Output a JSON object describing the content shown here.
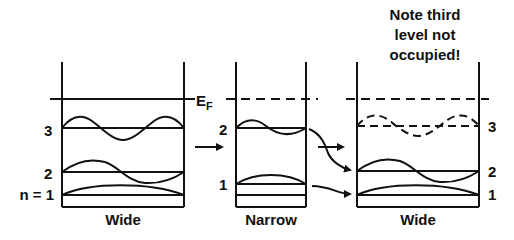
{
  "diagram": {
    "note": [
      "Note third",
      "level not",
      "occupied!"
    ],
    "fermi_label": "E",
    "fermi_sub": "F",
    "wells": [
      {
        "name": "wide-left",
        "label": "Wide",
        "levels": [
          "3",
          "2",
          "n = 1"
        ]
      },
      {
        "name": "narrow",
        "label": "Narrow",
        "levels": [
          "2",
          "1"
        ]
      },
      {
        "name": "wide-right",
        "label": "Wide",
        "levels": [
          "3",
          "2",
          "1"
        ]
      }
    ],
    "colors": {
      "ink": "#111111",
      "background": "#ffffff"
    }
  }
}
